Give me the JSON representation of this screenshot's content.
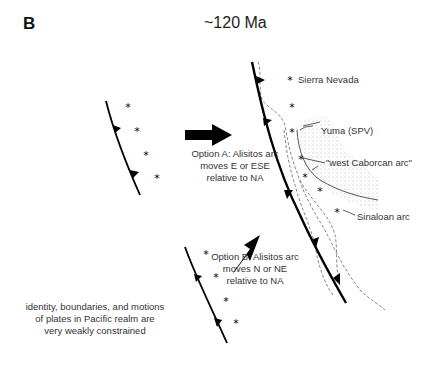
{
  "panel": {
    "letter": "B",
    "age": "~120 Ma"
  },
  "labels": {
    "sierra_nevada": "Sierra Nevada",
    "yuma": "Yuma (SPV)",
    "west_caborcan": "\"west Caborcan arc\"",
    "sinaloan": "Sinaloan arc"
  },
  "options": {
    "a": [
      "Option A: Alisitos arc",
      "moves E or ESE",
      "relative to NA"
    ],
    "b": [
      "Option B: Alisitos arc",
      "moves N or NE",
      "relative to NA"
    ]
  },
  "note": [
    "identity, boundaries, and motions",
    "of plates in Pacific realm are",
    "very weakly constrained"
  ]
}
